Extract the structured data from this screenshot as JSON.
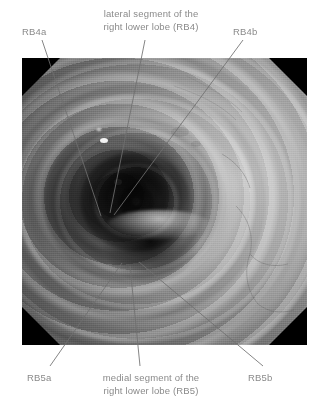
{
  "figure": {
    "type": "annotated-endoscopic-photograph",
    "modality": "bronchoscopy",
    "image_alt": "Grayscale bronchoscopic view of the right lower lobe bronchus showing the lateral (RB4) and medial (RB5) segmental orifices with sub-segmental openings",
    "frame": {
      "x": 22,
      "y": 58,
      "width": 285,
      "height": 287
    },
    "mask_shape": "octagon-black-corners"
  },
  "annotations": [
    {
      "id": "rb4a",
      "label": "RB4a",
      "position": "top-left",
      "text_x": 22,
      "text_y": 26,
      "line": {
        "x1": 42,
        "y1": 40,
        "x2": 101,
        "y2": 216
      }
    },
    {
      "id": "rb4",
      "label": "lateral segment of the\nright lower lobe (RB4)",
      "position": "top-center",
      "text_x": 92,
      "text_y": 8,
      "line": {
        "x1": 145,
        "y1": 40,
        "x2": 110,
        "y2": 213
      }
    },
    {
      "id": "rb4b",
      "label": "RB4b",
      "position": "top-right",
      "text_x": 233,
      "text_y": 26,
      "line": {
        "x1": 243,
        "y1": 40,
        "x2": 114,
        "y2": 215
      }
    },
    {
      "id": "rb5a",
      "label": "RB5a",
      "position": "bottom-left",
      "text_x": 27,
      "text_y": 372,
      "line": {
        "x1": 50,
        "y1": 366,
        "x2": 122,
        "y2": 263
      }
    },
    {
      "id": "rb5",
      "label": "medial segment of the\nright lower lobe (RB5)",
      "position": "bottom-center",
      "text_x": 88,
      "text_y": 372,
      "line": {
        "x1": 140,
        "y1": 366,
        "x2": 130,
        "y2": 266
      }
    },
    {
      "id": "rb5b",
      "label": "RB5b",
      "position": "bottom-right",
      "text_x": 248,
      "text_y": 372,
      "line": {
        "x1": 263,
        "y1": 366,
        "x2": 139,
        "y2": 262
      }
    }
  ],
  "colors": {
    "background": "#ffffff",
    "text": "#8a8a8a",
    "leader_line": "#6f6f6f",
    "mask": "#000000"
  }
}
